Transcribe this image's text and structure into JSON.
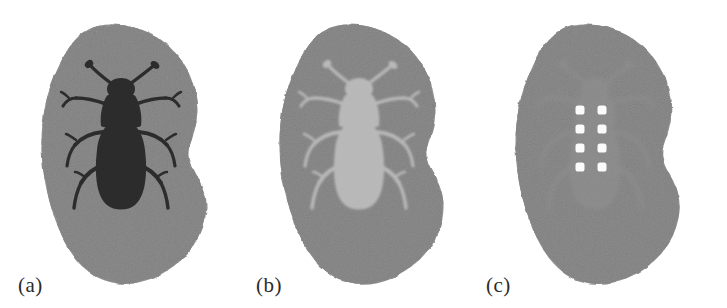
{
  "figure": {
    "background_color": "#ffffff",
    "width": 727,
    "height": 308,
    "panel_count": 3
  },
  "colors": {
    "page_background": "#ffffff",
    "blob_gray": "#8d8d8d",
    "blob_gray_dark": "#858585",
    "beetle_black": "#0a0a0a",
    "beetle_light": "#cfcfcf",
    "beetle_faint": "#949494",
    "dot_white": "#fbfbfb",
    "label_text": "#2b2b2b"
  },
  "panels": [
    {
      "id": "a",
      "label": "(a)",
      "blob_name": "irregular-gray-blob",
      "subject": "beetle-silhouette",
      "subject_tone": "black",
      "subject_description": "High-contrast black beetle silhouette on mid-gray noisy blob",
      "dots_visible": false,
      "dot_count": 0
    },
    {
      "id": "b",
      "label": "(b)",
      "blob_name": "irregular-gray-blob",
      "subject": "beetle-silhouette",
      "subject_tone": "light-gray",
      "subject_description": "Low-contrast light-gray beetle on mid-gray noisy blob",
      "dots_visible": false,
      "dot_count": 0
    },
    {
      "id": "c",
      "label": "(c)",
      "blob_name": "irregular-gray-blob",
      "subject": "beetle-silhouette",
      "subject_tone": "near-background",
      "subject_description": "Near-invisible beetle on mid-gray noisy blob with white dot grid overlay",
      "dots_visible": true,
      "dot_count": 8,
      "dot_grid_rows": 4,
      "dot_grid_cols": 2
    }
  ],
  "beetle": {
    "name": "beetle",
    "parts": [
      "antenna-left",
      "antenna-right",
      "head",
      "pronotum",
      "elytra",
      "leg-front-left",
      "leg-front-right",
      "leg-mid-left",
      "leg-mid-right",
      "leg-hind-left",
      "leg-hind-right"
    ],
    "leg_pairs": 3,
    "antennae": 2
  },
  "dot_grid": {
    "name": "white-dot-grid",
    "rows": 4,
    "cols": 2,
    "dot_shape": "rounded-square",
    "dot_size_px": 9,
    "col_x": [
      106,
      128
    ],
    "row_y": [
      110,
      129,
      148,
      167
    ],
    "color": "#fbfbfb"
  }
}
